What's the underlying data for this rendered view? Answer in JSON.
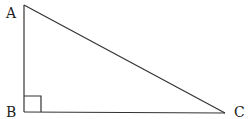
{
  "diagram": {
    "vertices": {
      "A": {
        "label": "A",
        "x": 24,
        "y": 5
      },
      "B": {
        "label": "B",
        "x": 24,
        "y": 112
      },
      "C": {
        "label": "C",
        "x": 225,
        "y": 113
      }
    },
    "right_angle_at": "B",
    "colors": {
      "stroke": "#333333",
      "text": "#222222"
    }
  }
}
